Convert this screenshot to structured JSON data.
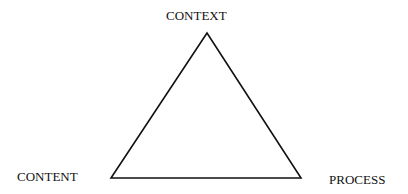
{
  "diagram": {
    "shape": "triangle",
    "vertices": {
      "top": {
        "label": "CONTEXT"
      },
      "bottom_left": {
        "label": "CONTENT"
      },
      "bottom_right": {
        "label": "PROCESS"
      }
    },
    "stroke_color": "#111111",
    "background_color": "#ffffff"
  }
}
